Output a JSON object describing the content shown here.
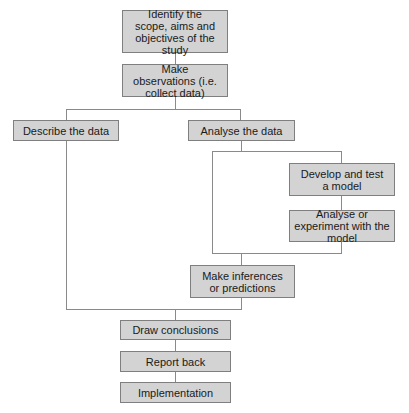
{
  "diagram": {
    "type": "flowchart",
    "colors": {
      "box_fill": "#d3d3d3",
      "box_border": "#7f7f7f",
      "connector": "#8a8a8a",
      "text": "#1a1a1a",
      "background": "#ffffff"
    },
    "nodes": {
      "scope": {
        "label": "Identify the scope, aims and objectives of the study"
      },
      "observe": {
        "label": "Make observations (i.e. collect data)"
      },
      "describe": {
        "label": "Describe the data"
      },
      "analyse": {
        "label": "Analyse the data"
      },
      "develop": {
        "label": "Develop and test a model"
      },
      "experiment": {
        "label": "Analyse or experiment with the model"
      },
      "inferences": {
        "label": "Make inferences or predictions"
      },
      "conclusions": {
        "label": "Draw conclusions"
      },
      "report": {
        "label": "Report back"
      },
      "implementation": {
        "label": "Implementation"
      }
    },
    "edges": [
      [
        "scope",
        "observe"
      ],
      [
        "observe",
        "describe"
      ],
      [
        "observe",
        "analyse"
      ],
      [
        "analyse",
        "develop"
      ],
      [
        "develop",
        "experiment"
      ],
      [
        "analyse",
        "inferences"
      ],
      [
        "experiment",
        "inferences"
      ],
      [
        "describe",
        "conclusions"
      ],
      [
        "inferences",
        "conclusions"
      ],
      [
        "conclusions",
        "report"
      ],
      [
        "report",
        "implementation"
      ]
    ]
  }
}
